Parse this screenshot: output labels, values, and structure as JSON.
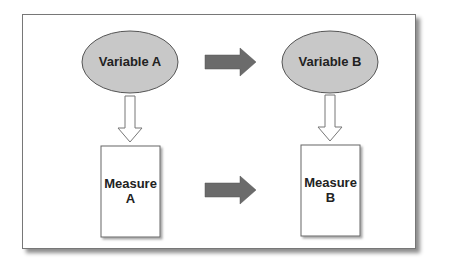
{
  "diagram": {
    "nodes": [
      {
        "id": "variable_a",
        "shape": "ellipse",
        "label": "Variable A"
      },
      {
        "id": "variable_b",
        "shape": "ellipse",
        "label": "Variable B"
      },
      {
        "id": "measure_a",
        "shape": "rectangle",
        "label_line1": "Measure",
        "label_line2": "A"
      },
      {
        "id": "measure_b",
        "shape": "rectangle",
        "label_line1": "Measure",
        "label_line2": "B"
      }
    ],
    "edges": [
      {
        "from": "variable_a",
        "to": "variable_b",
        "style": "filled-gray"
      },
      {
        "from": "variable_a",
        "to": "measure_a",
        "style": "outline"
      },
      {
        "from": "variable_b",
        "to": "measure_b",
        "style": "outline"
      },
      {
        "from": "measure_a",
        "to": "measure_b",
        "style": "filled-gray"
      }
    ],
    "colors": {
      "ellipse_fill": "#c8c8c8",
      "arrow_fill": "#6b6b6b",
      "border": "#555555"
    }
  }
}
